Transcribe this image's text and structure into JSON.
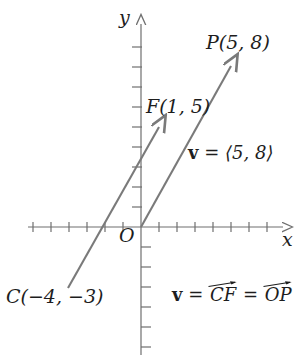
{
  "figure": {
    "type": "vector-diagram",
    "colors": {
      "axis": "#6f6f6f",
      "vector": "#7a7a7a",
      "text": "#1d1d1d",
      "background": "#ffffff"
    },
    "axes": {
      "x_label": "x",
      "y_label": "y",
      "origin_label": "O",
      "origin_px": {
        "x": 141,
        "y": 227
      },
      "tick_spacing_px": {
        "x": 18,
        "y": 20
      },
      "x_ticks_left": 6,
      "x_ticks_right": 7,
      "y_ticks_up": 9,
      "y_ticks_down": 6
    },
    "points": [
      {
        "name": "P",
        "label": "P(5, 8)",
        "x": 5,
        "y": 8
      },
      {
        "name": "F",
        "label": "F(1, 5)",
        "x": 1,
        "y": 5
      },
      {
        "name": "C",
        "label": "C(−4, −3)",
        "x": -4,
        "y": -3
      },
      {
        "name": "O",
        "label": "O",
        "x": 0,
        "y": 0
      }
    ],
    "vectors": [
      {
        "name": "CF",
        "from": {
          "x": -4,
          "y": -3
        },
        "to": {
          "x": 1,
          "y": 5
        },
        "from_px": {
          "x": 68,
          "y": 288
        },
        "to_px": {
          "x": 159,
          "y": 127
        }
      },
      {
        "name": "OP",
        "from": {
          "x": 0,
          "y": 0
        },
        "to": {
          "x": 5,
          "y": 8
        },
        "from_px": {
          "x": 141,
          "y": 227
        },
        "to_px": {
          "x": 231,
          "y": 66
        }
      }
    ],
    "annotations": {
      "component_form": {
        "vector_symbol": "v",
        "equals": "=",
        "components": "⟨5, 8⟩"
      },
      "equality": {
        "vector_symbol": "v",
        "equals_1": "=",
        "term_1": "CF",
        "equals_2": "=",
        "term_2": "OP"
      }
    }
  }
}
